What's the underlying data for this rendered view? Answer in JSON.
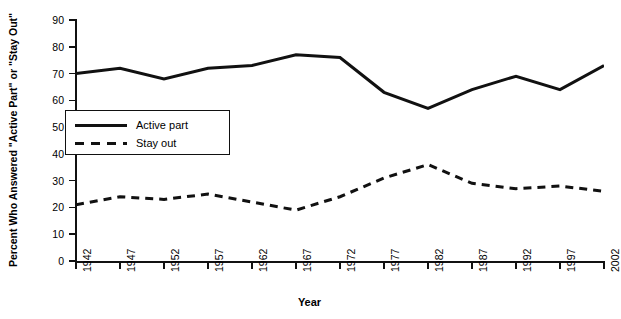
{
  "chart_data": {
    "type": "line",
    "title": "",
    "xlabel": "Year",
    "ylabel": "Percent Who Answered \"Active Part\" or \"Stay Out\"",
    "xlim": [
      1942,
      2002
    ],
    "ylim": [
      0,
      90
    ],
    "ytick_step": 10,
    "xtick_step": 5,
    "grid": false,
    "legend_position": "inside-left",
    "x": [
      1942,
      1947,
      1952,
      1957,
      1962,
      1967,
      1972,
      1977,
      1982,
      1987,
      1992,
      1997,
      2002
    ],
    "series": [
      {
        "name": "Active part",
        "style": "solid",
        "color": "#111111",
        "values": [
          70,
          72,
          68,
          72,
          73,
          77,
          76,
          63,
          57,
          64,
          69,
          64,
          73
        ]
      },
      {
        "name": "Stay out",
        "style": "dashed",
        "color": "#111111",
        "values": [
          21,
          24,
          23,
          25,
          22,
          19,
          24,
          31,
          36,
          29,
          27,
          28,
          26
        ]
      }
    ],
    "ytick_labels": [
      "0",
      "10",
      "20",
      "30",
      "40",
      "50",
      "60",
      "70",
      "80",
      "90"
    ],
    "xtick_labels": [
      "1942",
      "1947",
      "1952",
      "1957",
      "1962",
      "1967",
      "1972",
      "1977",
      "1982",
      "1987",
      "1992",
      "1997",
      "2002"
    ]
  },
  "legend": {
    "items": [
      {
        "label": "Active part",
        "style": "solid"
      },
      {
        "label": "Stay out",
        "style": "dashed"
      }
    ]
  }
}
